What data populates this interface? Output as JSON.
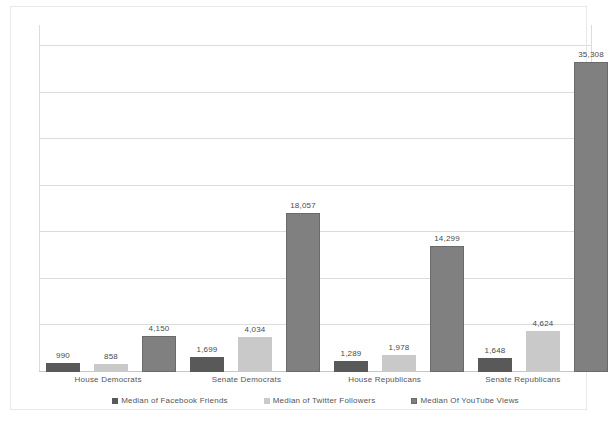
{
  "chart_data": {
    "type": "bar",
    "title": "",
    "subtitle": "",
    "xlabel": "",
    "ylabel": "",
    "grid": true,
    "legend_position": "bottom",
    "ylim": [
      0,
      39500
    ],
    "gridline_count": 7,
    "categories": [
      "House Democrats",
      "Senate Democrats",
      "House Republicans",
      "Senate Republicans"
    ],
    "series": [
      {
        "name": "Median of Facebook Friends",
        "color": "#595959",
        "values": [
          990,
          1699,
          1289,
          1648
        ],
        "labels": [
          "990",
          "1,699",
          "1,289",
          "1,648"
        ]
      },
      {
        "name": "Median of Twitter Followers",
        "color": "#c9c9c9",
        "values": [
          858,
          4034,
          1978,
          4624
        ],
        "labels": [
          "858",
          "4,034",
          "1,978",
          "4,624"
        ]
      },
      {
        "name": "Median Of YouTube Views",
        "color": "#808080",
        "values": [
          4150,
          18057,
          14299,
          35308
        ],
        "labels": [
          "4,150",
          "18,057",
          "14,299",
          "35,308"
        ]
      }
    ]
  },
  "colors": {
    "series_facebook": "#595959",
    "series_twitter": "#c9c9c9",
    "series_youtube": "#808080",
    "gridline": "#dcdcdc",
    "axis": "#c6c6c6",
    "text": "#555555",
    "background": "#ffffff"
  }
}
